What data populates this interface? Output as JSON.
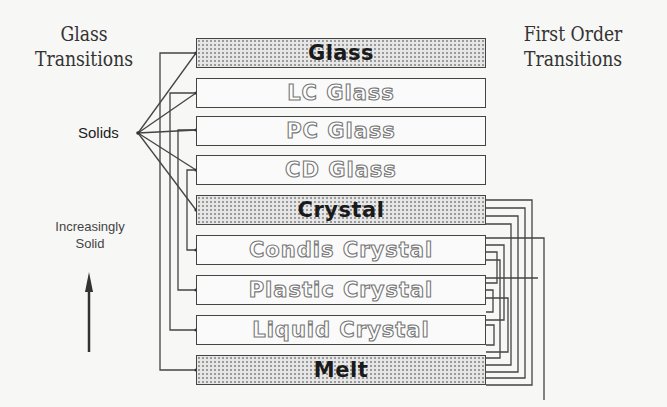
{
  "headings": {
    "left": [
      "Glass",
      "Transitions"
    ],
    "right": [
      "First Order",
      "Transitions"
    ]
  },
  "annotations": {
    "solids": "Solids",
    "direction": [
      "Increasingly",
      "Solid"
    ]
  },
  "states": [
    {
      "label": "Glass",
      "style": "filled"
    },
    {
      "label": "LC Glass",
      "style": "outline"
    },
    {
      "label": "PC Glass",
      "style": "outline"
    },
    {
      "label": "CD Glass",
      "style": "outline"
    },
    {
      "label": "Crystal",
      "style": "filled"
    },
    {
      "label": "Condis Crystal",
      "style": "outline"
    },
    {
      "label": "Plastic Crystal",
      "style": "outline"
    },
    {
      "label": "Liquid  Crystal",
      "style": "outline"
    },
    {
      "label": "Melt",
      "style": "filled"
    }
  ],
  "colors": {
    "line": "#444444",
    "fill": "#e6e6e6",
    "outline_text": "#777777"
  }
}
